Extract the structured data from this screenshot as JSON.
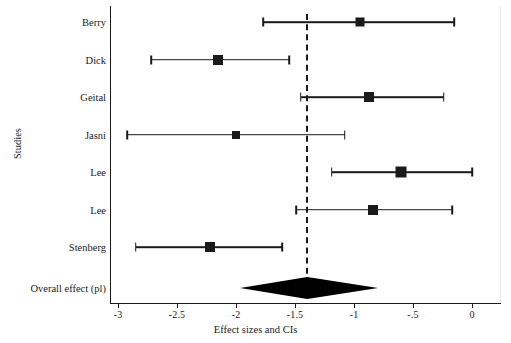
{
  "chart_data": {
    "type": "forest",
    "title": "",
    "xlabel": "Effect sizes and CIs",
    "ylabel": "Studies",
    "xlim": [
      -3.1,
      0.2
    ],
    "xticks": [
      -3,
      -2.5,
      -2,
      -1.5,
      -1,
      -0.5,
      0
    ],
    "xticklabels": [
      "-3",
      "-2.5",
      "-2",
      "-1.5",
      "-1",
      "-.5",
      "0"
    ],
    "grid": false,
    "legend": "none",
    "reference_line": {
      "value": -1.4,
      "style": "dashed",
      "label": "overall effect reference"
    },
    "studies": [
      {
        "label": "Berry",
        "effect": -0.95,
        "ci_low": -1.77,
        "ci_high": -0.15,
        "marker_size": 9
      },
      {
        "label": "Dick",
        "effect": -2.15,
        "ci_low": -2.72,
        "ci_high": -1.55,
        "marker_size": 10
      },
      {
        "label": "Geital",
        "effect": -0.87,
        "ci_low": -1.45,
        "ci_high": -0.24,
        "marker_size": 10
      },
      {
        "label": "Jasni",
        "effect": -2.0,
        "ci_low": -2.92,
        "ci_high": -1.08,
        "marker_size": 8
      },
      {
        "label": "Lee",
        "effect": -0.6,
        "ci_low": -1.19,
        "ci_high": 0.0,
        "marker_size": 11
      },
      {
        "label": "Lee",
        "effect": -0.84,
        "ci_low": -1.49,
        "ci_high": -0.17,
        "marker_size": 10
      },
      {
        "label": "Stenberg",
        "effect": -2.22,
        "ci_low": -2.85,
        "ci_high": -1.61,
        "marker_size": 10
      }
    ],
    "overall": {
      "label": "Overall effect (pl)",
      "effect": -1.4,
      "ci_low": -1.97,
      "ci_high": -0.8,
      "shape": "diamond"
    },
    "colors": {
      "marker": "#1a1a1a",
      "line": "#1a1a1a",
      "diamond": "#000000",
      "background": "#ffffff"
    }
  }
}
